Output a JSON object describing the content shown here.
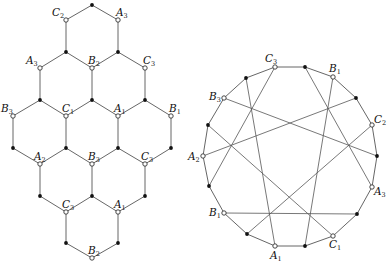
{
  "figure": {
    "left_panel": {
      "name": "hexagonal-lattice",
      "vertices": [
        {
          "id": "t0",
          "x": 92,
          "y": 5,
          "type": "black"
        },
        {
          "id": "t1",
          "x": 66,
          "y": 20,
          "type": "open",
          "label": "C",
          "sub": "2",
          "lx": -14,
          "ly": -4
        },
        {
          "id": "t2",
          "x": 118,
          "y": 20,
          "type": "open",
          "label": "A",
          "sub": "3",
          "lx": -2,
          "ly": -4
        },
        {
          "id": "t3",
          "x": 66,
          "y": 52,
          "type": "black"
        },
        {
          "id": "t4",
          "x": 118,
          "y": 52,
          "type": "black"
        },
        {
          "id": "r1a",
          "x": 40,
          "y": 68,
          "type": "open",
          "label": "A",
          "sub": "3",
          "lx": -14,
          "ly": -4
        },
        {
          "id": "r1b",
          "x": 92,
          "y": 68,
          "type": "open",
          "label": "B",
          "sub": "2",
          "lx": -4,
          "ly": -4
        },
        {
          "id": "r1c",
          "x": 145,
          "y": 68,
          "type": "open",
          "label": "C",
          "sub": "3",
          "lx": -2,
          "ly": -4
        },
        {
          "id": "r2a",
          "x": 40,
          "y": 100,
          "type": "black"
        },
        {
          "id": "r2b",
          "x": 92,
          "y": 100,
          "type": "black"
        },
        {
          "id": "r2c",
          "x": 145,
          "y": 100,
          "type": "black"
        },
        {
          "id": "r3a",
          "x": 13,
          "y": 116,
          "type": "open",
          "label": "B",
          "sub": "3",
          "lx": -12,
          "ly": -4
        },
        {
          "id": "r3b",
          "x": 66,
          "y": 116,
          "type": "open",
          "label": "C",
          "sub": "1",
          "lx": -4,
          "ly": -4
        },
        {
          "id": "r3c",
          "x": 118,
          "y": 116,
          "type": "open",
          "label": "A",
          "sub": "1",
          "lx": -4,
          "ly": -4
        },
        {
          "id": "r3d",
          "x": 171,
          "y": 116,
          "type": "open",
          "label": "B",
          "sub": "1",
          "lx": -2,
          "ly": -4
        },
        {
          "id": "r4a",
          "x": 13,
          "y": 148,
          "type": "black"
        },
        {
          "id": "r4b",
          "x": 66,
          "y": 148,
          "type": "black"
        },
        {
          "id": "r4c",
          "x": 118,
          "y": 148,
          "type": "black"
        },
        {
          "id": "r4d",
          "x": 171,
          "y": 148,
          "type": "black"
        },
        {
          "id": "r5a",
          "x": 40,
          "y": 164,
          "type": "open",
          "label": "A",
          "sub": "2",
          "lx": -6,
          "ly": -4
        },
        {
          "id": "r5b",
          "x": 92,
          "y": 164,
          "type": "open",
          "label": "B",
          "sub": "3",
          "lx": -4,
          "ly": -4
        },
        {
          "id": "r5c",
          "x": 145,
          "y": 164,
          "type": "open",
          "label": "C",
          "sub": "3",
          "lx": -4,
          "ly": -4
        },
        {
          "id": "r6a",
          "x": 40,
          "y": 196,
          "type": "black"
        },
        {
          "id": "r6b",
          "x": 92,
          "y": 196,
          "type": "black"
        },
        {
          "id": "r6c",
          "x": 145,
          "y": 196,
          "type": "black"
        },
        {
          "id": "r7a",
          "x": 66,
          "y": 212,
          "type": "open",
          "label": "C",
          "sub": "3",
          "lx": -4,
          "ly": -4
        },
        {
          "id": "r7b",
          "x": 118,
          "y": 212,
          "type": "open",
          "label": "A",
          "sub": "1",
          "lx": -4,
          "ly": -4
        },
        {
          "id": "r8a",
          "x": 66,
          "y": 243,
          "type": "black"
        },
        {
          "id": "r8b",
          "x": 118,
          "y": 243,
          "type": "black"
        },
        {
          "id": "r9",
          "x": 92,
          "y": 258,
          "type": "open",
          "label": "B",
          "sub": "2",
          "lx": -4,
          "ly": -4
        }
      ],
      "edges": [
        [
          "t0",
          "t1"
        ],
        [
          "t0",
          "t2"
        ],
        [
          "t1",
          "t3"
        ],
        [
          "t2",
          "t4"
        ],
        [
          "t3",
          "r1a"
        ],
        [
          "t3",
          "r1b"
        ],
        [
          "t4",
          "r1b"
        ],
        [
          "t4",
          "r1c"
        ],
        [
          "r1a",
          "r2a"
        ],
        [
          "r1b",
          "r2b"
        ],
        [
          "r1c",
          "r2c"
        ],
        [
          "r2a",
          "r3a"
        ],
        [
          "r2a",
          "r3b"
        ],
        [
          "r2b",
          "r3b"
        ],
        [
          "r2b",
          "r3c"
        ],
        [
          "r2c",
          "r3c"
        ],
        [
          "r2c",
          "r3d"
        ],
        [
          "r3a",
          "r4a"
        ],
        [
          "r3b",
          "r4b"
        ],
        [
          "r3c",
          "r4c"
        ],
        [
          "r3d",
          "r4d"
        ],
        [
          "r4a",
          "r5a"
        ],
        [
          "r4b",
          "r5a"
        ],
        [
          "r4b",
          "r5b"
        ],
        [
          "r4c",
          "r5b"
        ],
        [
          "r4c",
          "r5c"
        ],
        [
          "r4d",
          "r5c"
        ],
        [
          "r5a",
          "r6a"
        ],
        [
          "r5b",
          "r6b"
        ],
        [
          "r5c",
          "r6c"
        ],
        [
          "r6a",
          "r7a"
        ],
        [
          "r6b",
          "r7a"
        ],
        [
          "r6b",
          "r7b"
        ],
        [
          "r6c",
          "r7b"
        ],
        [
          "r7a",
          "r8a"
        ],
        [
          "r7b",
          "r8b"
        ],
        [
          "r8a",
          "r9"
        ],
        [
          "r8b",
          "r9"
        ]
      ]
    },
    "right_panel": {
      "name": "circular-graph",
      "vertices": [
        {
          "id": "p0",
          "x": 275,
          "y": 67,
          "type": "open",
          "label": "C",
          "sub": "3",
          "lx": -10,
          "ly": -5
        },
        {
          "id": "p1",
          "x": 305,
          "y": 67,
          "type": "black"
        },
        {
          "id": "p2",
          "x": 333,
          "y": 77,
          "type": "open",
          "label": "B",
          "sub": "1",
          "lx": -4,
          "ly": -5
        },
        {
          "id": "p3",
          "x": 356,
          "y": 98,
          "type": "black"
        },
        {
          "id": "p4",
          "x": 372,
          "y": 125,
          "type": "open",
          "label": "C",
          "sub": "2",
          "lx": 2,
          "ly": -2
        },
        {
          "id": "p5",
          "x": 377,
          "y": 156,
          "type": "black"
        },
        {
          "id": "p6",
          "x": 372,
          "y": 187,
          "type": "open",
          "label": "A",
          "sub": "3",
          "lx": 2,
          "ly": 8
        },
        {
          "id": "p7",
          "x": 357,
          "y": 214,
          "type": "black"
        },
        {
          "id": "p8",
          "x": 333,
          "y": 236,
          "type": "open",
          "label": "C",
          "sub": "1",
          "lx": -4,
          "ly": 12
        },
        {
          "id": "p9",
          "x": 305,
          "y": 246,
          "type": "black"
        },
        {
          "id": "p10",
          "x": 275,
          "y": 246,
          "type": "open",
          "label": "A",
          "sub": "1",
          "lx": -5,
          "ly": 13
        },
        {
          "id": "p11",
          "x": 247,
          "y": 234,
          "type": "black"
        },
        {
          "id": "p12",
          "x": 224,
          "y": 213,
          "type": "open",
          "label": "B",
          "sub": "1",
          "lx": -15,
          "ly": 3
        },
        {
          "id": "p13",
          "x": 209,
          "y": 186,
          "type": "black"
        },
        {
          "id": "p14",
          "x": 203,
          "y": 156,
          "type": "open",
          "label": "A",
          "sub": "2",
          "lx": -15,
          "ly": 4
        },
        {
          "id": "p15",
          "x": 208,
          "y": 125,
          "type": "black"
        },
        {
          "id": "p16",
          "x": 224,
          "y": 98,
          "type": "open",
          "label": "B",
          "sub": "3",
          "lx": -15,
          "ly": 2
        },
        {
          "id": "p17",
          "x": 246,
          "y": 78,
          "type": "black"
        }
      ],
      "chords": [
        [
          "p0",
          "p13"
        ],
        [
          "p17",
          "p10"
        ],
        [
          "p16",
          "p5"
        ],
        [
          "p15",
          "p8"
        ],
        [
          "p14",
          "p3"
        ],
        [
          "p12",
          "p7"
        ],
        [
          "p11",
          "p4"
        ],
        [
          "p1",
          "p6"
        ],
        [
          "p2",
          "p9"
        ]
      ]
    }
  }
}
